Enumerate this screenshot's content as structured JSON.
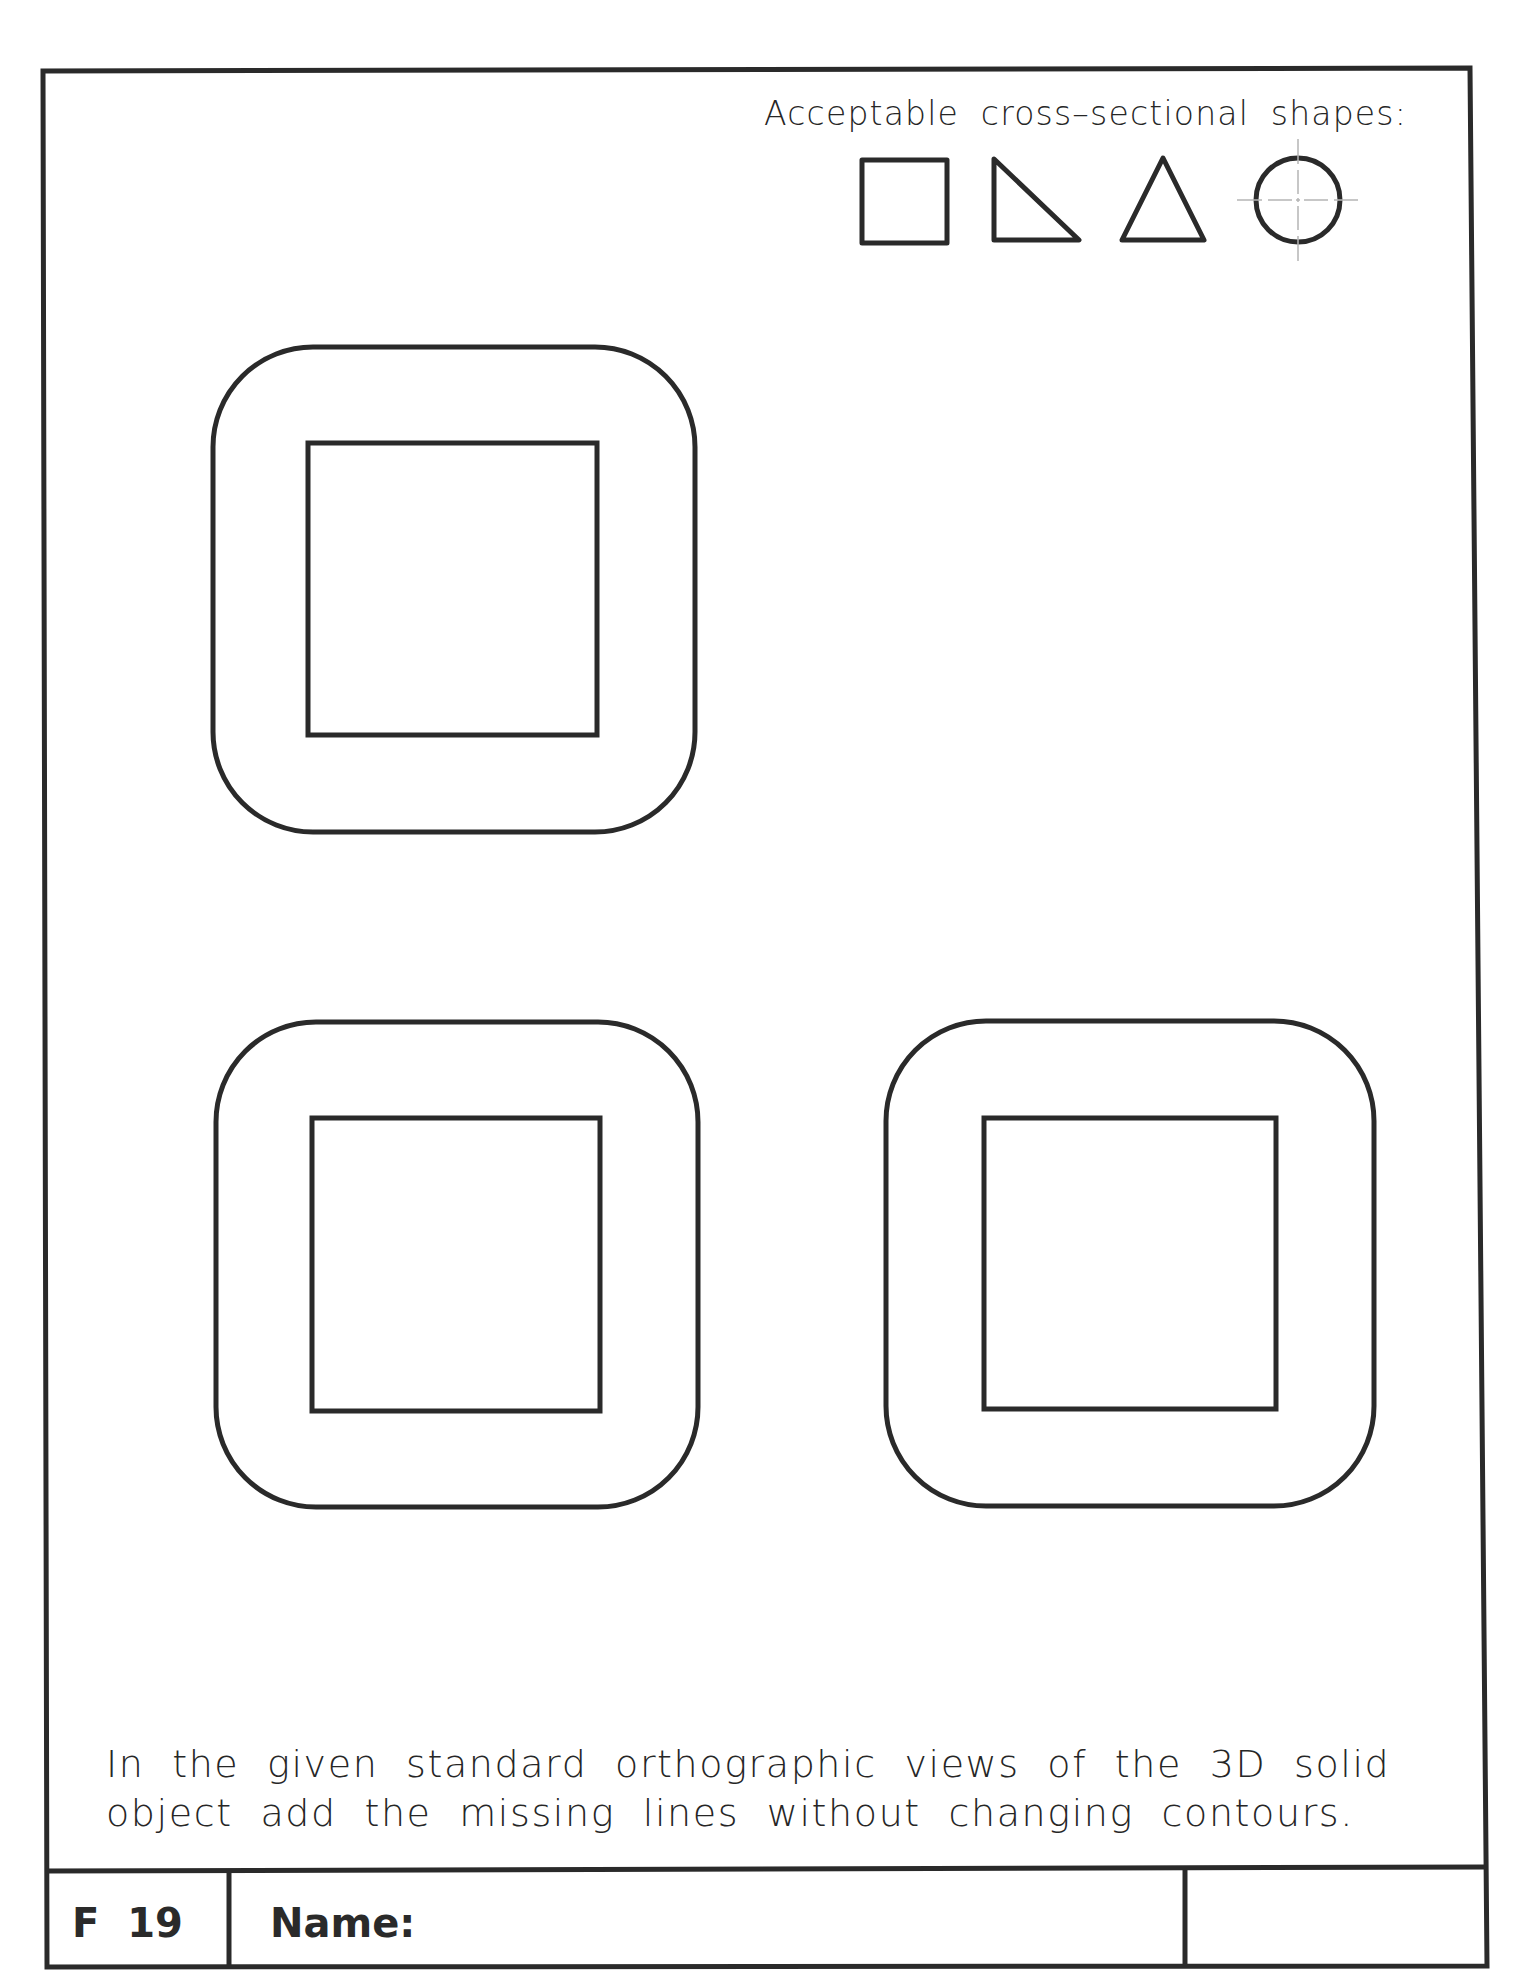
{
  "sheet": {
    "header": "Acceptable cross–sectional shapes:",
    "acceptable_shapes": [
      {
        "name": "square",
        "label": "square"
      },
      {
        "name": "right-triangle",
        "label": "right triangle"
      },
      {
        "name": "triangle",
        "label": "triangle"
      },
      {
        "name": "circle",
        "label": "circle"
      }
    ],
    "instructions": {
      "line1": "In the given standard orthographic views of the 3D solid",
      "line2": "object add the missing lines without changing contours."
    },
    "title_block": {
      "sheet_id": "F 19",
      "name_label": "Name:",
      "name_value": "",
      "extra_value": ""
    },
    "views": [
      {
        "name": "top-view",
        "outer": {
          "x": 213,
          "y": 347,
          "w": 482,
          "h": 485,
          "r": 100
        },
        "inner": {
          "x": 308,
          "y": 443,
          "w": 289,
          "h": 292
        }
      },
      {
        "name": "front-view",
        "outer": {
          "x": 216,
          "y": 1022,
          "w": 482,
          "h": 485,
          "r": 100
        },
        "inner": {
          "x": 312,
          "y": 1118,
          "w": 288,
          "h": 293
        }
      },
      {
        "name": "side-view",
        "outer": {
          "x": 886,
          "y": 1021,
          "w": 488,
          "h": 485,
          "r": 100
        },
        "inner": {
          "x": 984,
          "y": 1118,
          "w": 292,
          "h": 291
        }
      }
    ],
    "colors": {
      "ink": "#2a2a2a",
      "centerline": "#b5b5b5",
      "paper": "#ffffff"
    }
  }
}
